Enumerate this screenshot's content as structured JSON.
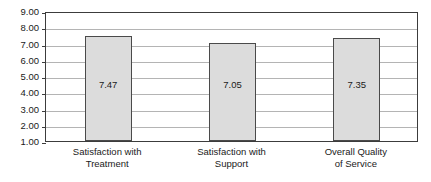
{
  "chart_data": {
    "type": "bar",
    "title": "",
    "subtitle": "",
    "xlabel": "",
    "ylabel": "",
    "ylim": [
      1.0,
      9.0
    ],
    "ytick_step": 1.0,
    "grid": true,
    "legend": false,
    "legend_position": "none",
    "categories": [
      "Satisfaction with Treatment",
      "Satisfaction with Support",
      "Overall Quality of Service"
    ],
    "category_lines": [
      [
        "Satisfaction with",
        "Treatment"
      ],
      [
        "Satisfaction with",
        "Support"
      ],
      [
        "Overall Quality",
        "of Service"
      ]
    ],
    "values": [
      7.47,
      7.05,
      7.35
    ],
    "value_labels": [
      "7.47",
      "7.05",
      "7.35"
    ],
    "ytick_labels": [
      "9.00",
      "8.00",
      "7.00",
      "6.00",
      "5.00",
      "4.00",
      "3.00",
      "2.00",
      "1.00"
    ],
    "ytick_values": [
      9.0,
      8.0,
      7.0,
      6.0,
      5.0,
      4.0,
      3.0,
      2.0,
      1.0
    ],
    "colors": {
      "bar_fill": "#dcdcdc",
      "bar_border": "#4a4a4a",
      "gridline": "#b4b4b4",
      "axis": "#3c3c3c",
      "text": "#1a1a1a",
      "background": "#ffffff"
    }
  }
}
